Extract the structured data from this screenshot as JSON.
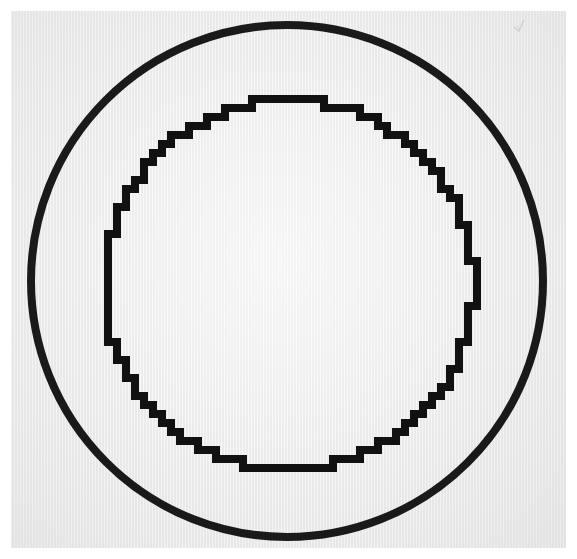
{
  "figure": {
    "title": "Two concentric circles",
    "canvas": {
      "width": 577,
      "height": 559,
      "page_color": "#ffffff"
    },
    "paper": {
      "left": 11,
      "top": 11,
      "width": 555,
      "height": 537,
      "color": "#eeeeef",
      "texture": "vertical-scan-lines"
    },
    "shapes": [
      {
        "name": "outer-circle",
        "kind": "circle-outline",
        "center_x": 287,
        "center_y": 281,
        "radius": 256,
        "stroke_width": 8,
        "stroke_color": "#111111",
        "rendering": "antialiased-smooth",
        "bbox": {
          "left": 31,
          "top": 25,
          "right": 543,
          "bottom": 537
        }
      },
      {
        "name": "inner-circle",
        "kind": "circle-outline",
        "center_x": 289,
        "center_y": 285,
        "radius": 185,
        "stroke_width": 8,
        "stroke_color": "#111111",
        "rendering": "aliased-stair-stepped",
        "step_size": 9,
        "bbox": {
          "left": 104,
          "top": 100,
          "right": 474,
          "bottom": 470
        }
      }
    ],
    "artifacts": [
      {
        "name": "pencil-scratch",
        "x": 518,
        "y": 22,
        "width": 13,
        "height": 12,
        "color": "#c9c9cb"
      }
    ],
    "palette": {
      "ink": "#111111",
      "paper": "#eeeeef",
      "page": "#ffffff",
      "artifact": "#c9c9cb"
    }
  }
}
